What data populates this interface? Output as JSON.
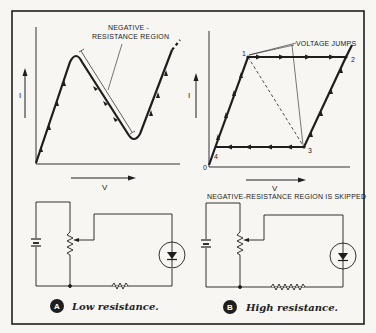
{
  "figure": {
    "panel_a": {
      "graph": {
        "y_axis_label": "I",
        "x_axis_label": "V",
        "annotation": [
          "NEGATIVE -",
          "RESISTANCE REGION"
        ]
      },
      "badge": "A",
      "caption": "Low resistance."
    },
    "panel_b": {
      "graph": {
        "y_axis_label": "I",
        "x_axis_label": "V",
        "annotation": "VOLTAGE JUMPS",
        "points": [
          "0",
          "1",
          "2",
          "3",
          "4"
        ]
      },
      "circuit_title": "NEGATIVE-RESISTANCE REGION IS SKIPPED",
      "badge": "B",
      "caption": "High resistance."
    },
    "colors": {
      "ink": "#1e1e1e",
      "paper": "#f7f6f3"
    }
  }
}
